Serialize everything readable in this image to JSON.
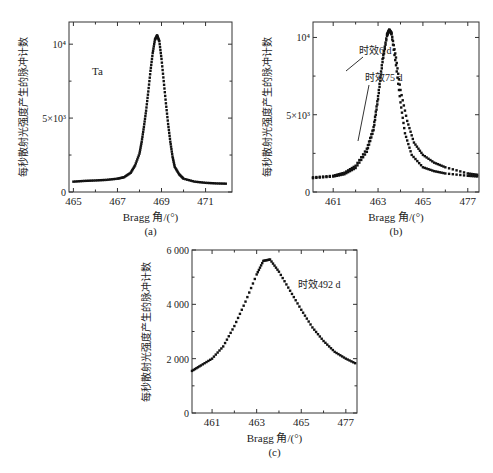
{
  "chart_data": [
    {
      "panel": "a",
      "type": "scatter",
      "caption": "(a)",
      "annotation": "Ta",
      "xlabel": "Bragg 角/(°)",
      "ylabel": "每秒散射光强度产生的脉冲计数",
      "xticks": [
        "465",
        "467",
        "469",
        "471"
      ],
      "yticks": [
        "0",
        "5×10³",
        "10⁴"
      ],
      "xlim": [
        464.8,
        472.2
      ],
      "ylim": [
        0,
        11500
      ],
      "series": [
        {
          "name": "Ta",
          "x": [
            465,
            465.5,
            466,
            466.5,
            467,
            467.3,
            467.6,
            467.8,
            468.0,
            468.1,
            468.2,
            468.3,
            468.4,
            468.5,
            468.6,
            468.7,
            468.8,
            468.9,
            469.0,
            469.1,
            469.2,
            469.3,
            469.4,
            469.5,
            469.6,
            469.8,
            470.0,
            470.5,
            471,
            471.5,
            472
          ],
          "y": [
            700,
            750,
            780,
            820,
            900,
            1000,
            1300,
            1800,
            2600,
            3400,
            4400,
            5500,
            6800,
            8200,
            9400,
            10300,
            10600,
            10200,
            9000,
            7500,
            6000,
            4600,
            3400,
            2400,
            1700,
            1200,
            900,
            700,
            620,
            580,
            560
          ]
        }
      ]
    },
    {
      "panel": "b",
      "type": "scatter",
      "caption": "(b)",
      "xlabel": "Bragg 角/(°)",
      "ylabel": "每秒散射光强度产生的脉冲计数",
      "xticks": [
        "461",
        "463",
        "465",
        "477"
      ],
      "yticks": [
        "0",
        "5×10³",
        "10⁴"
      ],
      "xlim": [
        460.1,
        467.5
      ],
      "ylim": [
        0,
        11000
      ],
      "annotations": [
        "时效6 d",
        "时效75 d"
      ],
      "series": [
        {
          "name": "时效6 d",
          "x": [
            460.1,
            461,
            461.5,
            462,
            462.5,
            462.8,
            463.0,
            463.2,
            463.4,
            463.5,
            463.6,
            463.8,
            464.0,
            464.2,
            464.5,
            465,
            465.5,
            466,
            467,
            467.5
          ],
          "y": [
            950,
            1050,
            1250,
            1700,
            2800,
            4200,
            6200,
            8600,
            10200,
            10500,
            10200,
            8200,
            5800,
            3800,
            2400,
            1600,
            1350,
            1200,
            1050,
            1000
          ]
        },
        {
          "name": "时效75 d",
          "x": [
            460.1,
            461,
            461.5,
            462,
            462.5,
            462.8,
            463.0,
            463.2,
            463.4,
            463.5,
            463.6,
            463.8,
            464.0,
            464.3,
            464.6,
            465,
            465.5,
            466,
            467,
            467.5
          ],
          "y": [
            900,
            1000,
            1150,
            1550,
            2600,
            4000,
            6000,
            8400,
            10100,
            10500,
            10300,
            8700,
            6600,
            4600,
            3200,
            2400,
            1900,
            1600,
            1200,
            1100
          ]
        }
      ]
    },
    {
      "panel": "c",
      "type": "scatter",
      "caption": "(c)",
      "annotation": "时效492 d",
      "xlabel": "Bragg 角/(°)",
      "ylabel": "每秒散射光强度产生的脉冲计数",
      "xticks": [
        "461",
        "463",
        "465",
        "477"
      ],
      "yticks": [
        "0",
        "2 000",
        "4 000",
        "6 000"
      ],
      "xlim": [
        460.1,
        467.5
      ],
      "ylim": [
        0,
        6000
      ],
      "series": [
        {
          "name": "时效492 d",
          "x": [
            460.1,
            460.5,
            461,
            461.5,
            462,
            462.5,
            463,
            463.3,
            463.6,
            464,
            464.5,
            465,
            465.5,
            466,
            466.5,
            467,
            467.5
          ],
          "y": [
            1550,
            1750,
            2000,
            2450,
            3200,
            4100,
            5100,
            5600,
            5650,
            5200,
            4500,
            3800,
            3150,
            2650,
            2250,
            2000,
            1800
          ]
        }
      ]
    }
  ]
}
